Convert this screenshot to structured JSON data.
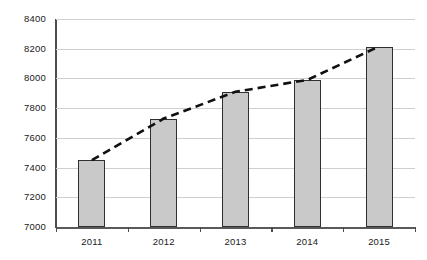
{
  "chart_data": {
    "type": "bar",
    "title": "",
    "subtitle": "",
    "xlabel": "",
    "ylabel": "",
    "categories": [
      "2011",
      "2012",
      "2013",
      "2014",
      "2015"
    ],
    "series": [
      {
        "name": "Value",
        "type": "bar",
        "values": [
          7450,
          7730,
          7910,
          7990,
          8215
        ]
      },
      {
        "name": "Trend",
        "type": "line",
        "style": "dashed",
        "values": [
          7450,
          7730,
          7910,
          7990,
          8215
        ]
      }
    ],
    "ylim": [
      7000,
      8400
    ],
    "yticks": [
      7000,
      7200,
      7400,
      7600,
      7800,
      8000,
      8200,
      8400
    ],
    "ytick_labels": [
      "7000",
      "7200",
      "7400",
      "7600",
      "7800",
      "8000",
      "8200",
      "8400"
    ],
    "xtick_labels": [
      "2011",
      "2012",
      "2013",
      "2014",
      "2015"
    ],
    "grid": "horizontal",
    "legend": "none",
    "colors": {
      "bar_fill": "#c9c9c9",
      "bar_border": "#303030",
      "gridline": "#cfcfcf",
      "axis": "#4d4d4d",
      "trendline": "#111111",
      "background": "#ffffff",
      "text": "#1a1a1a"
    }
  }
}
